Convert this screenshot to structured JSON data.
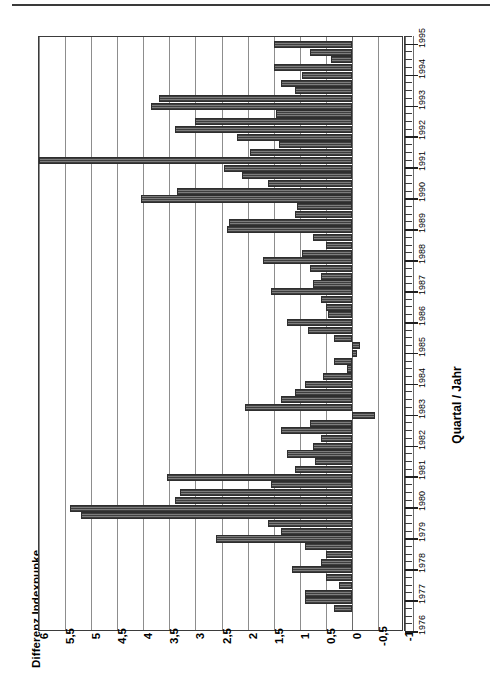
{
  "figure": {
    "title": "Differenz Indexpunke",
    "axis_caption": "Quartal / Jahr"
  },
  "chart_data": {
    "type": "bar",
    "title": "Differenz Indexpunke",
    "xlabel": "Quartal / Jahr",
    "ylabel": "Differenz Indexpunke",
    "orientation": "horizontal-rotated",
    "grid": true,
    "legend": null,
    "ylim": [
      -1,
      6
    ],
    "yticks": [
      6,
      5.5,
      5,
      4.5,
      4,
      3.5,
      3,
      2.5,
      2,
      1.5,
      1,
      0.5,
      0,
      -0.5,
      -1
    ],
    "ytick_labels": [
      "6",
      "5,5",
      "5",
      "4,5",
      "4",
      "3,5",
      "3",
      "2,5",
      "2",
      "1,5",
      "1",
      "0,5",
      "0",
      "-0,5",
      "-1"
    ],
    "xticks": [
      1976,
      1977,
      1978,
      1979,
      1980,
      1981,
      1982,
      1983,
      1984,
      1985,
      1986,
      1987,
      1988,
      1989,
      1990,
      1991,
      1992,
      1993,
      1994,
      1995
    ],
    "xtick_labels": [
      "1976",
      "1977",
      "1978",
      "1979",
      "1980",
      "1981",
      "1982",
      "1983",
      "1984",
      "1985",
      "1986",
      "1987",
      "1988",
      "1989",
      "1990",
      "1991",
      "1992",
      "1993",
      "1994",
      "1995"
    ],
    "xlim": [
      1976,
      1995.25
    ],
    "categories": [
      "1976 Q4",
      "1977 Q1",
      "1977 Q2",
      "1977 Q3",
      "1977 Q4",
      "1978 Q1",
      "1978 Q2",
      "1978 Q3",
      "1978 Q4",
      "1979 Q1",
      "1979 Q2",
      "1979 Q3",
      "1979 Q4",
      "1980 Q1",
      "1980 Q2",
      "1980 Q3",
      "1980 Q4",
      "1981 Q1",
      "1981 Q2",
      "1981 Q3",
      "1981 Q4",
      "1982 Q1",
      "1982 Q2",
      "1982 Q3",
      "1982 Q4",
      "1983 Q1",
      "1983 Q2",
      "1983 Q3",
      "1983 Q4",
      "1984 Q1",
      "1984 Q2",
      "1984 Q3",
      "1984 Q4",
      "1985 Q1",
      "1985 Q2",
      "1985 Q3",
      "1985 Q4",
      "1986 Q1",
      "1986 Q2",
      "1986 Q3",
      "1986 Q4",
      "1987 Q1",
      "1987 Q2",
      "1987 Q3",
      "1987 Q4",
      "1988 Q1",
      "1988 Q2",
      "1988 Q3",
      "1988 Q4",
      "1989 Q1",
      "1989 Q2",
      "1989 Q3",
      "1989 Q4",
      "1990 Q1",
      "1990 Q2",
      "1990 Q3",
      "1990 Q4",
      "1991 Q1",
      "1991 Q2",
      "1991 Q3",
      "1991 Q4",
      "1992 Q1",
      "1992 Q2",
      "1992 Q3",
      "1992 Q4",
      "1993 Q1",
      "1993 Q2",
      "1993 Q3",
      "1993 Q4",
      "1994 Q1",
      "1994 Q2",
      "1994 Q3",
      "1994 Q4",
      "1995 Q1"
    ],
    "values": [
      0.35,
      0.9,
      0.9,
      0.25,
      0.5,
      1.15,
      0.6,
      0.5,
      0.9,
      2.6,
      1.35,
      1.6,
      5.2,
      5.4,
      3.4,
      3.3,
      1.55,
      3.55,
      1.1,
      0.7,
      1.25,
      0.75,
      0.6,
      1.35,
      0.8,
      -0.45,
      2.05,
      1.35,
      1.1,
      0.9,
      0.55,
      0.1,
      0.35,
      -0.1,
      -0.15,
      0.35,
      0.85,
      1.25,
      0.45,
      0.5,
      0.6,
      1.55,
      0.75,
      0.6,
      0.8,
      1.7,
      0.95,
      0.5,
      0.75,
      2.4,
      2.35,
      1.1,
      1.05,
      4.05,
      3.35,
      1.6,
      2.1,
      2.45,
      6.0,
      1.95,
      1.4,
      2.2,
      3.4,
      3.0,
      1.45,
      3.85,
      3.7,
      1.1,
      1.35,
      0.95,
      1.5,
      0.4,
      0.8,
      1.5
    ]
  }
}
